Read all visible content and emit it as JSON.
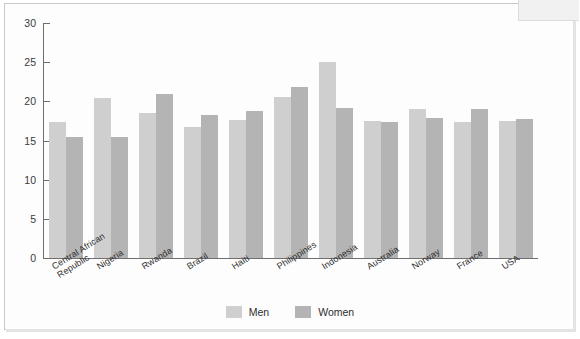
{
  "chart_data": {
    "type": "bar",
    "title": "",
    "subtitle": "",
    "xlabel": "",
    "ylabel": "",
    "ylim": [
      0,
      30
    ],
    "yticks": [
      0,
      5,
      10,
      15,
      20,
      25,
      30
    ],
    "grid": false,
    "legend_position": "bottom-center",
    "categories": [
      "Central African\nRepublic",
      "Nigeria",
      "Rwanda",
      "Brazil",
      "Haiti",
      "Philippines",
      "Indonesia",
      "Australia",
      "Norway",
      "France",
      "USA"
    ],
    "series": [
      {
        "name": "Men",
        "color": "#cfcfcf",
        "values": [
          17.3,
          20.4,
          18.5,
          16.7,
          17.6,
          20.6,
          25.0,
          17.5,
          19.0,
          17.4,
          17.5
        ]
      },
      {
        "name": "Women",
        "color": "#b4b4b4",
        "values": [
          15.4,
          15.5,
          20.9,
          18.2,
          18.8,
          21.8,
          19.1,
          17.4,
          17.9,
          19.0,
          17.7
        ]
      }
    ]
  },
  "legend": {
    "items": [
      {
        "label": "Men",
        "color": "#cfcfcf"
      },
      {
        "label": "Women",
        "color": "#b4b4b4"
      }
    ]
  }
}
